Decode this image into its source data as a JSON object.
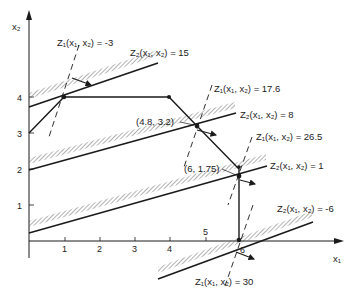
{
  "axes": {
    "x_label": "x₁",
    "y_label": "x₂",
    "x_ticks": [
      "1",
      "2",
      "3",
      "4",
      "5",
      "6"
    ],
    "y_ticks": [
      "1",
      "2",
      "3",
      "4"
    ]
  },
  "feasible_boundary": {
    "vertices": [
      [
        0,
        3
      ],
      [
        1,
        4
      ],
      [
        4,
        4
      ],
      [
        4.8,
        3.2
      ],
      [
        6,
        1.75
      ],
      [
        6,
        0
      ]
    ]
  },
  "points": {
    "p1": "(4.8, 3.2)",
    "p2": "(6, 1.75)"
  },
  "z1_lines": [
    {
      "label": "Z₁(x₁, x₂) = -3",
      "value": -3
    },
    {
      "label": "Z₁(x₁, x₂) = 17.6",
      "value": 17.6
    },
    {
      "label": "Z₁(x₁, x₂) = 26.5",
      "value": 26.5
    },
    {
      "label": "Z₁(x₁, x₂) = 30",
      "value": 30
    }
  ],
  "z2_lines": [
    {
      "label": "Z₂(x₁, x₂) = 15",
      "value": 15
    },
    {
      "label": "Z₂(x₁, x₂) = 8",
      "value": 8
    },
    {
      "label": "Z₂(x₁, x₂) = 1",
      "value": 1
    },
    {
      "label": "Z₂(x₁, x₂) = -6",
      "value": -6
    }
  ],
  "colors": {
    "line": "#1a1a1a",
    "hatch": "#555555",
    "background": "#ffffff"
  }
}
